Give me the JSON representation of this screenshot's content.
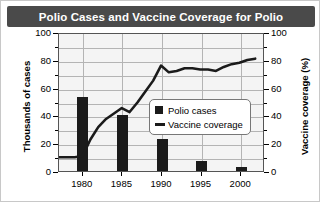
{
  "chart_data": {
    "type": "bar",
    "title": "Polio Cases and Vaccine Coverage for Polio",
    "xlabel": "",
    "ylabel": "Thousands of cases",
    "y2label": "Vaccine coverage (%)",
    "xlim": [
      1977,
      2003
    ],
    "ylim": [
      0,
      100
    ],
    "y2lim": [
      0,
      100
    ],
    "y_ticks": [
      0,
      20,
      40,
      60,
      80,
      100
    ],
    "y2_ticks": [
      0,
      20,
      40,
      60,
      80,
      100
    ],
    "x_ticks": [
      1980,
      1985,
      1990,
      1995,
      2000
    ],
    "x_tick_labels": [
      "1980",
      "1985",
      "1990",
      "1995",
      "2000"
    ],
    "grid": true,
    "legend_position": "center",
    "series": [
      {
        "name": "Polio cases",
        "type": "bar",
        "axis": "left",
        "unit": "thousands of cases",
        "color": "#1b1b1b",
        "x": [
          1980,
          1985,
          1990,
          1995,
          2000
        ],
        "values": [
          53,
          40,
          23,
          7,
          3
        ]
      },
      {
        "name": "Vaccine coverage",
        "type": "line",
        "axis": "right",
        "unit": "%",
        "color": "#1b1b1b",
        "x": [
          1977,
          1978,
          1979,
          1980,
          1981,
          1982,
          1983,
          1984,
          1985,
          1986,
          1987,
          1988,
          1989,
          1990,
          1991,
          1992,
          1993,
          1994,
          1995,
          1996,
          1997,
          1998,
          1999,
          2000,
          2001,
          2002
        ],
        "values": [
          10,
          10,
          10,
          11,
          23,
          32,
          38,
          42,
          46,
          43,
          50,
          58,
          66,
          77,
          72,
          73,
          75,
          75,
          74,
          74,
          73,
          76,
          78,
          79,
          81,
          82
        ]
      }
    ]
  },
  "legend": {
    "items": [
      {
        "label": "Polio cases",
        "marker": "square"
      },
      {
        "label": "Vaccine coverage",
        "marker": "line"
      }
    ]
  },
  "colors": {
    "title_bar": "#4a4a4a",
    "title_text": "#ffffff",
    "plot_background": "#f4f4f4",
    "grid": "#b4b4b4",
    "data": "#1b1b1b",
    "frame": "#555555"
  }
}
